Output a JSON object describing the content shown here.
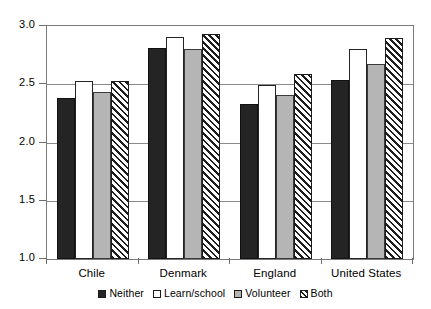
{
  "chart_data": {
    "type": "bar",
    "title": "",
    "subtitle": "",
    "xlabel": "",
    "ylabel": "",
    "categories": [
      "Chile",
      "Denmark",
      "England",
      "United States"
    ],
    "series": [
      {
        "name": "Neither",
        "pattern": "solid-black",
        "color": "#242424",
        "values": [
          2.38,
          2.81,
          2.33,
          2.54
        ]
      },
      {
        "name": "Learn/school",
        "pattern": "solid-white",
        "color": "#ffffff",
        "values": [
          2.53,
          2.91,
          2.49,
          2.8
        ]
      },
      {
        "name": "Volunteer",
        "pattern": "solid-gray",
        "color": "#b5b5b5",
        "values": [
          2.43,
          2.8,
          2.41,
          2.67
        ]
      },
      {
        "name": "Both",
        "pattern": "diagonal-hatch",
        "color": "#1d1d1d",
        "values": [
          2.53,
          2.93,
          2.59,
          2.9
        ]
      }
    ],
    "ylim": [
      1.0,
      3.0
    ],
    "ytick_values": [
      1.0,
      1.5,
      2.0,
      2.5,
      3.0
    ],
    "ytick_labels": [
      "1.0",
      "1.5",
      "2.0",
      "2.5",
      "3.0"
    ],
    "grid": true,
    "grid_axis": "y",
    "legend_position": "bottom"
  },
  "legend": {
    "entries": [
      {
        "label": "Neither"
      },
      {
        "label": "Learn/school"
      },
      {
        "label": "Volunteer"
      },
      {
        "label": "Both"
      }
    ]
  }
}
